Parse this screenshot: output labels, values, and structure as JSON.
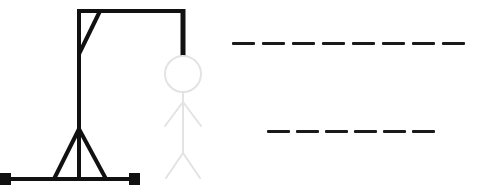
{
  "game": {
    "name": "Hangman",
    "colors": {
      "gallows": "#111111",
      "figure_hidden": "#e3e3e3",
      "blank": "#1a1a1a",
      "background": "#ffffff"
    },
    "gallows": {
      "parts": [
        "base",
        "left-foot",
        "right-foot",
        "pole",
        "left-strut",
        "right-strut",
        "top-beam",
        "brace",
        "rope"
      ]
    },
    "figure": {
      "parts": [
        "head",
        "body",
        "left-arm",
        "right-arm",
        "left-leg",
        "right-leg"
      ],
      "revealed": []
    },
    "words": [
      {
        "length": 8,
        "letters": [
          "",
          "",
          "",
          "",
          "",
          "",
          "",
          ""
        ]
      },
      {
        "length": 6,
        "letters": [
          "",
          "",
          "",
          "",
          "",
          ""
        ]
      }
    ]
  }
}
